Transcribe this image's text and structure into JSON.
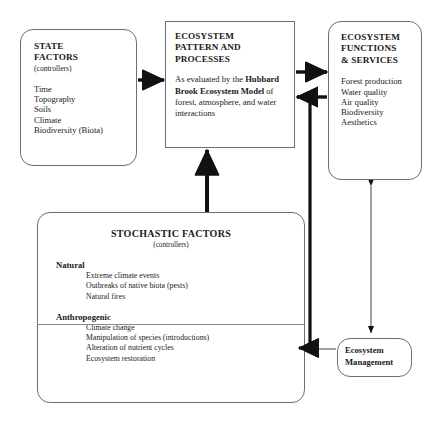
{
  "state_factors": {
    "heading_line1": "STATE",
    "heading_line2": "FACTORS",
    "subheading": "(controllers)",
    "items": [
      "Time",
      "Topography",
      "Soils",
      "Climate",
      "Biodiversity (Biota)"
    ]
  },
  "ecosystem_pattern": {
    "heading_line1": "ECOSYSTEM",
    "heading_line2": "PATTERN AND",
    "heading_line3": "PROCESSES",
    "para_lead": "As evaluated by the ",
    "para_bold": "Hubbard Brook Ecosystem Model",
    "para_tail": " of forest, atmosphere, and water interactions"
  },
  "ecosystem_functions": {
    "heading_line1": "ECOSYSTEM",
    "heading_line2": "FUNCTIONS",
    "heading_line3": "& SERVICES",
    "items": [
      "Forest production",
      "Water quality",
      "Air quality",
      "Biodiversity",
      "Aesthetics"
    ]
  },
  "stochastic_factors": {
    "title": "STOCHASTIC FACTORS",
    "subtitle": "(controllers)",
    "natural": {
      "label": "Natural",
      "items": [
        "Extreme climate events",
        "Outbreaks of native biota (pests)",
        "Natural fires"
      ]
    },
    "anthropogenic": {
      "label": "Anthropogenic",
      "items": [
        "Climate change",
        "Manipulation of species (introductions)",
        "Alteration of nutrient cycles",
        "Ecosystem restoration"
      ]
    }
  },
  "ecosystem_management": {
    "line1": "Ecosystem",
    "line2": "Management"
  },
  "connectors": [
    {
      "name": "state-factors-to-pattern",
      "style": "thick-arrow-right",
      "from": "state_factors",
      "to": "ecosystem_pattern"
    },
    {
      "name": "pattern-to-functions",
      "style": "thick-arrow-right",
      "from": "ecosystem_pattern",
      "to": "ecosystem_functions"
    },
    {
      "name": "functions-feedback-to-pattern",
      "style": "thick-arrow-left",
      "from": "ecosystem_functions",
      "to": "ecosystem_pattern"
    },
    {
      "name": "stochastic-to-pattern",
      "style": "thick-arrow-up",
      "from": "stochastic_factors",
      "to": "ecosystem_pattern"
    },
    {
      "name": "functions-to-stochastic",
      "style": "thick-arrow-left-elbow",
      "from": "ecosystem_functions",
      "to": "stochastic_factors"
    },
    {
      "name": "management-to-stochastic",
      "style": "thin-arrow-left",
      "from": "ecosystem_management",
      "to": "stochastic_factors"
    },
    {
      "name": "functions-management-bidirectional",
      "style": "thin-double-arrow-vertical",
      "from": "ecosystem_functions",
      "to": "ecosystem_management"
    }
  ],
  "colors": {
    "ink": "#1a1a1a",
    "stroke": "#6e6e6e",
    "arrow": "#111111",
    "background": "#ffffff"
  }
}
